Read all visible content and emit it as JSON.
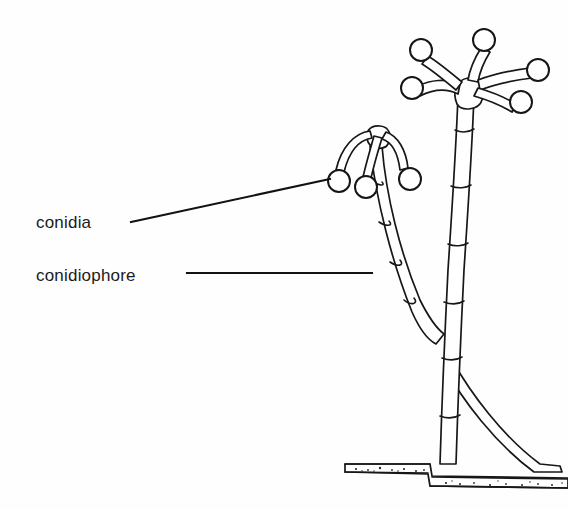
{
  "figure": {
    "background_color": "#fefefe",
    "ink_color": "#171717",
    "width": 568,
    "height": 509
  },
  "labels": [
    {
      "id": "conidia",
      "text": "conidia",
      "x": 36,
      "y": 228,
      "leader": {
        "from_x": 131,
        "from_y": 222,
        "to_x": 330,
        "to_y": 179,
        "style": "diagonal"
      }
    },
    {
      "id": "conidiophore",
      "text": "conidiophore",
      "x": 36,
      "y": 281,
      "leader": {
        "from_x": 187,
        "from_y": 273,
        "to_x": 372,
        "to_y": 273,
        "style": "horizontal"
      }
    }
  ],
  "structures": {
    "tall_conidiophore": {
      "name": "tall conidiophore",
      "apex_x": 470,
      "apex_y": 98,
      "base_x": 438,
      "base_y": 470,
      "arm_count": 5,
      "conidia_positions": [
        {
          "cx": 412,
          "cy": 88
        },
        {
          "cx": 421,
          "cy": 50
        },
        {
          "cx": 484,
          "cy": 40
        },
        {
          "cx": 538,
          "cy": 70
        },
        {
          "cx": 521,
          "cy": 102
        }
      ]
    },
    "short_conidiophore": {
      "name": "short conidiophore",
      "apex_x": 378,
      "apex_y": 136,
      "base_x": 432,
      "base_y": 330,
      "arm_count": 3,
      "conidia_positions": [
        {
          "cx": 339,
          "cy": 181
        },
        {
          "cx": 366,
          "cy": 187
        },
        {
          "cx": 410,
          "cy": 179
        }
      ]
    },
    "ground_hypha": {
      "name": "ground hypha",
      "left_x": 345,
      "right_x": 568,
      "y": 470
    }
  },
  "conidium": {
    "radius": 11,
    "texture": "stippled"
  }
}
